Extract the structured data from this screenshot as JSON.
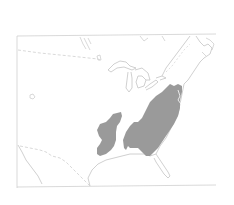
{
  "map": {
    "subject": "Species range map, eastern United States",
    "region": "Eastern and central United States with southern Canada",
    "colors": {
      "background": "#ffffff",
      "frame": "#c8c8c8",
      "coastline": "#c4c4c4",
      "border_dashed": "#cfcfcf",
      "range_fill": "#9a9a9a"
    },
    "layers": [
      {
        "name": "frame",
        "type": "rectangle"
      },
      {
        "name": "great-lakes",
        "type": "outline"
      },
      {
        "name": "atlantic-coastline",
        "type": "outline"
      },
      {
        "name": "gulf-coastline",
        "type": "outline"
      },
      {
        "name": "florida-peninsula",
        "type": "outline"
      },
      {
        "name": "us-canada-border",
        "type": "dashed"
      },
      {
        "name": "us-mexico-border",
        "type": "dashed"
      },
      {
        "name": "range-west",
        "type": "filled-region"
      },
      {
        "name": "range-east",
        "type": "filled-region"
      }
    ]
  }
}
